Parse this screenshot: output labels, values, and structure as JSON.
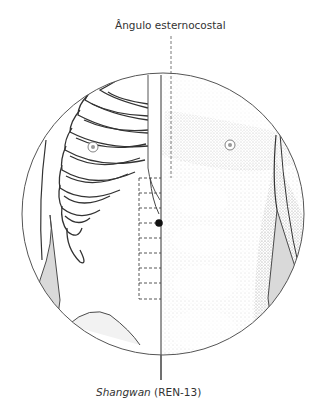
{
  "figure": {
    "labels": {
      "top": "Ângulo esternocostal",
      "bottom_point_name": "Shangwan",
      "bottom_point_code": " (REN-13)"
    },
    "colors": {
      "line": "#4a4a4a",
      "point": "#111111",
      "shading": "#d9d9d9",
      "background": "#ffffff"
    },
    "grid": {
      "cells": 8,
      "orientation": "vertical dashed scale along midline"
    },
    "marked_point": {
      "name": "Shangwan",
      "code": "REN-13"
    }
  }
}
